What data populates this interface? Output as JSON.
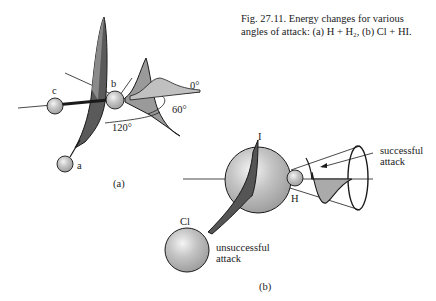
{
  "caption": {
    "line1": "Fig. 27.11.  Energy changes for various",
    "line2": "angles of attack: (a) H + H₂, (b) Cl + HI."
  },
  "panel_a": {
    "label": "(a)",
    "atoms": [
      "a",
      "b",
      "c"
    ],
    "angles": [
      "0°",
      "60°",
      "120°"
    ]
  },
  "panel_b": {
    "label": "(b)",
    "atoms": [
      "I",
      "H",
      "Cl"
    ],
    "annotations": {
      "successful_line1": "successful",
      "successful_line2": "attack",
      "unsuccessful_line1": "unsuccessful",
      "unsuccessful_line2": "attack"
    }
  },
  "colors": {
    "ink": "#1a1a1a",
    "dark_fill": "#555555",
    "mid_fill": "#9a9a9a",
    "light_fill": "#c8c8c8",
    "sphere": "#b5b5b5"
  }
}
